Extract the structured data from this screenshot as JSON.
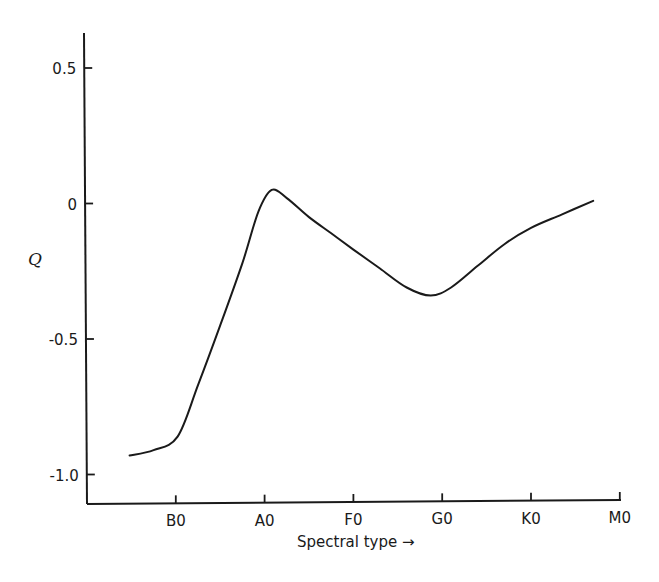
{
  "chart_data": {
    "type": "line",
    "title": "",
    "xlabel": "Spectral type →",
    "ylabel": "Q",
    "x_categories": [
      "B0",
      "A0",
      "F0",
      "G0",
      "K0",
      "M0"
    ],
    "x_category_index": [
      1,
      2,
      3,
      4,
      5,
      6
    ],
    "yticks": [
      0.5,
      0,
      -0.5,
      -1.0
    ],
    "ytick_labels": [
      "0.5",
      "0",
      "-0.5",
      "-1.0"
    ],
    "ylim": [
      -1.1,
      0.63
    ],
    "grid": false,
    "legend": null,
    "series": [
      {
        "name": "Q",
        "x": [
          0.48,
          0.75,
          1.02,
          1.25,
          1.5,
          1.75,
          1.93,
          2.08,
          2.25,
          2.5,
          2.75,
          3.0,
          3.3,
          3.6,
          3.87,
          4.1,
          4.4,
          4.7,
          5.0,
          5.35,
          5.7
        ],
        "y": [
          -0.93,
          -0.91,
          -0.86,
          -0.67,
          -0.45,
          -0.22,
          -0.03,
          0.05,
          0.02,
          -0.05,
          -0.11,
          -0.17,
          -0.24,
          -0.31,
          -0.34,
          -0.31,
          -0.23,
          -0.15,
          -0.09,
          -0.04,
          0.01
        ]
      }
    ],
    "annotations": []
  },
  "axes": {
    "y_label": "Q",
    "x_label": "Spectral type →",
    "colors": {
      "line": "#1a1a1a",
      "background": "#ffffff"
    }
  }
}
